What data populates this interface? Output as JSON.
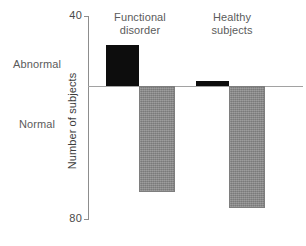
{
  "chart_data": {
    "type": "bar",
    "title": "",
    "xlabel": "",
    "ylabel": "Number of subjects",
    "ylim": [
      40,
      80
    ],
    "grid": false,
    "legend_position": "none",
    "orientation": "vertical-diverging",
    "baseline_value": 49,
    "axis_ticks": [
      "40",
      "80"
    ],
    "row_labels": [
      "Abnormal",
      "Normal"
    ],
    "categories": [
      "Functional disorder",
      "Healthy subjects"
    ],
    "series": [
      {
        "name": "Abnormal",
        "color": "#0d0d0d",
        "values": [
          8,
          1
        ]
      },
      {
        "name": "Normal",
        "color": "#8a8a8a",
        "values": [
          21,
          24
        ]
      }
    ],
    "bars": [
      {
        "group": "Functional disorder",
        "series": "Abnormal",
        "value": 8,
        "direction": "up",
        "color": "#0d0d0d"
      },
      {
        "group": "Functional disorder",
        "series": "Normal",
        "value": 21,
        "direction": "down",
        "color": "#8a8a8a"
      },
      {
        "group": "Healthy subjects",
        "series": "Abnormal",
        "value": 1,
        "direction": "up",
        "color": "#0d0d0d"
      },
      {
        "group": "Healthy subjects",
        "series": "Normal",
        "value": 24,
        "direction": "down",
        "color": "#8a8a8a"
      }
    ]
  },
  "axis": {
    "top_tick_label": "40",
    "bottom_tick_label": "80",
    "y_title": "Number of subjects"
  },
  "side_labels": {
    "abnormal": "Abnormal",
    "normal": "Normal"
  },
  "groups": [
    {
      "line1": "Functional",
      "line2": "disorder"
    },
    {
      "line1": "Healthy",
      "line2": "subjects"
    }
  ],
  "colors": {
    "abnormal_bar": "#0d0d0d",
    "normal_bar": "#8a8a8a",
    "axis": "#8d8d8d",
    "text": "#5b5b5b",
    "background": "#ffffff"
  }
}
